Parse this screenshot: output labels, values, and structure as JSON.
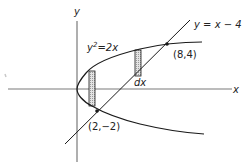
{
  "figure": {
    "axes": {
      "x_label": "x",
      "y_label": "y"
    },
    "curves": {
      "parabola": {
        "label_base": "y",
        "label_exp": "2",
        "label_rest": "=2x",
        "equation": "y^2 = 2x"
      },
      "line": {
        "label": "y = x − 4",
        "equation": "y = x - 4"
      }
    },
    "points": [
      {
        "label": "(8,4)",
        "x": 8,
        "y": 4
      },
      {
        "label": "(2,−2)",
        "x": 2,
        "y": -2
      }
    ],
    "strips": [
      {
        "name": "left-strip",
        "description": "vertical strip between parabola branches"
      },
      {
        "name": "right-strip",
        "description": "vertical strip between parabola and line",
        "label": "dx"
      }
    ],
    "colors": {
      "stroke": "#1a1a1a",
      "axis": "#7a7a7a",
      "strip_fill": "#c8c8c8"
    }
  }
}
